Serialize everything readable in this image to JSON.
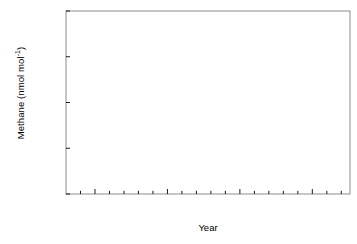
{
  "chart_data": {
    "type": "scatter",
    "title": "",
    "xlabel": "Year",
    "ylabel": "Methane (nmol mol",
    "ylabel_sup": "-1",
    "ylabel_tail": ")",
    "xlim": [
      1983.0,
      2002.6
    ],
    "ylim": [
      1600,
      1800
    ],
    "xticks_major": [
      1985,
      1990,
      1995,
      2000
    ],
    "xtick_labels": [
      "1985",
      "1990",
      "1995",
      "2000"
    ],
    "xticks_minor": [
      1984,
      1986,
      1987,
      1988,
      1989,
      1991,
      1992,
      1993,
      1994,
      1996,
      1997,
      1998,
      1999,
      2001,
      2002
    ],
    "yticks": [
      1600,
      1650,
      1700,
      1750,
      1800
    ],
    "ytick_labels": [
      "1600",
      "1650",
      "1700",
      "1750",
      "1800"
    ],
    "grid": false,
    "legend": null,
    "marker": "square",
    "marker_size_px": 4.6,
    "marker_color": "#000000",
    "frame_color": "#808080",
    "points": [
      [
        1983.3,
        1612
      ],
      [
        1983.46,
        1613
      ],
      [
        1983.96,
        1622
      ],
      [
        1984.05,
        1640
      ],
      [
        1984.13,
        1633
      ],
      [
        1984.21,
        1628
      ],
      [
        1984.3,
        1626
      ],
      [
        1984.38,
        1620
      ],
      [
        1984.46,
        1611
      ],
      [
        1984.55,
        1609
      ],
      [
        1984.63,
        1623
      ],
      [
        1984.71,
        1632
      ],
      [
        1984.8,
        1637
      ],
      [
        1984.88,
        1644
      ],
      [
        1985.05,
        1648
      ],
      [
        1985.13,
        1645
      ],
      [
        1985.21,
        1643
      ],
      [
        1985.3,
        1639
      ],
      [
        1985.38,
        1633
      ],
      [
        1985.46,
        1627
      ],
      [
        1985.55,
        1631
      ],
      [
        1985.63,
        1638
      ],
      [
        1985.71,
        1645
      ],
      [
        1985.8,
        1650
      ],
      [
        1985.88,
        1654
      ],
      [
        1986.05,
        1657
      ],
      [
        1986.13,
        1656
      ],
      [
        1986.21,
        1653
      ],
      [
        1986.3,
        1650
      ],
      [
        1986.38,
        1646
      ],
      [
        1986.46,
        1641
      ],
      [
        1986.55,
        1643
      ],
      [
        1986.63,
        1649
      ],
      [
        1986.71,
        1655
      ],
      [
        1986.8,
        1660
      ],
      [
        1986.88,
        1663
      ],
      [
        1987.05,
        1665
      ],
      [
        1987.13,
        1664
      ],
      [
        1987.21,
        1662
      ],
      [
        1987.3,
        1658
      ],
      [
        1987.38,
        1653
      ],
      [
        1987.46,
        1648
      ],
      [
        1987.55,
        1651
      ],
      [
        1987.63,
        1657
      ],
      [
        1987.71,
        1663
      ],
      [
        1987.8,
        1668
      ],
      [
        1987.88,
        1671
      ],
      [
        1988.05,
        1675
      ],
      [
        1988.13,
        1678
      ],
      [
        1988.21,
        1673
      ],
      [
        1988.3,
        1669
      ],
      [
        1988.38,
        1664
      ],
      [
        1988.46,
        1659
      ],
      [
        1988.55,
        1662
      ],
      [
        1988.63,
        1668
      ],
      [
        1988.71,
        1674
      ],
      [
        1988.8,
        1679
      ],
      [
        1988.88,
        1683
      ],
      [
        1989.05,
        1686
      ],
      [
        1989.13,
        1685
      ],
      [
        1989.21,
        1682
      ],
      [
        1989.3,
        1678
      ],
      [
        1989.38,
        1673
      ],
      [
        1989.46,
        1669
      ],
      [
        1989.55,
        1672
      ],
      [
        1989.63,
        1678
      ],
      [
        1989.71,
        1684
      ],
      [
        1989.8,
        1689
      ],
      [
        1989.88,
        1692
      ],
      [
        1990.05,
        1695
      ],
      [
        1990.13,
        1694
      ],
      [
        1990.21,
        1691
      ],
      [
        1990.3,
        1687
      ],
      [
        1990.38,
        1682
      ],
      [
        1990.46,
        1678
      ],
      [
        1990.55,
        1681
      ],
      [
        1990.63,
        1687
      ],
      [
        1990.71,
        1693
      ],
      [
        1990.8,
        1698
      ],
      [
        1990.88,
        1701
      ],
      [
        1991.05,
        1706
      ],
      [
        1991.13,
        1705
      ],
      [
        1991.21,
        1702
      ],
      [
        1991.3,
        1698
      ],
      [
        1991.38,
        1693
      ],
      [
        1991.46,
        1689
      ],
      [
        1991.55,
        1693
      ],
      [
        1991.63,
        1700
      ],
      [
        1991.71,
        1707
      ],
      [
        1991.8,
        1712
      ],
      [
        1991.88,
        1716
      ],
      [
        1992.05,
        1719
      ],
      [
        1992.13,
        1718
      ],
      [
        1992.21,
        1715
      ],
      [
        1992.3,
        1711
      ],
      [
        1992.38,
        1706
      ],
      [
        1992.46,
        1702
      ],
      [
        1992.55,
        1705
      ],
      [
        1992.63,
        1711
      ],
      [
        1992.71,
        1716
      ],
      [
        1992.8,
        1720
      ],
      [
        1992.88,
        1723
      ],
      [
        1993.05,
        1725
      ],
      [
        1993.13,
        1724
      ],
      [
        1993.21,
        1721
      ],
      [
        1993.3,
        1717
      ],
      [
        1993.38,
        1712
      ],
      [
        1993.46,
        1708
      ],
      [
        1993.55,
        1710
      ],
      [
        1993.63,
        1716
      ],
      [
        1993.71,
        1721
      ],
      [
        1993.8,
        1725
      ],
      [
        1993.88,
        1728
      ],
      [
        1994.05,
        1730
      ],
      [
        1994.13,
        1729
      ],
      [
        1994.21,
        1726
      ],
      [
        1994.3,
        1722
      ],
      [
        1994.38,
        1717
      ],
      [
        1994.46,
        1713
      ],
      [
        1994.55,
        1716
      ],
      [
        1994.63,
        1722
      ],
      [
        1994.71,
        1727
      ],
      [
        1994.8,
        1731
      ],
      [
        1994.88,
        1734
      ],
      [
        1995.05,
        1736
      ],
      [
        1995.13,
        1748
      ],
      [
        1995.21,
        1733
      ],
      [
        1995.3,
        1729
      ],
      [
        1995.38,
        1724
      ],
      [
        1995.46,
        1720
      ],
      [
        1995.55,
        1710
      ],
      [
        1995.63,
        1722
      ],
      [
        1995.71,
        1729
      ],
      [
        1995.8,
        1734
      ],
      [
        1995.88,
        1738
      ],
      [
        1996.05,
        1740
      ],
      [
        1996.13,
        1739
      ],
      [
        1996.21,
        1736
      ],
      [
        1996.3,
        1732
      ],
      [
        1996.38,
        1727
      ],
      [
        1996.46,
        1723
      ],
      [
        1996.55,
        1726
      ],
      [
        1996.63,
        1732
      ],
      [
        1996.71,
        1738
      ],
      [
        1996.8,
        1742
      ],
      [
        1996.88,
        1745
      ],
      [
        1997.05,
        1747
      ],
      [
        1997.13,
        1746
      ],
      [
        1997.21,
        1743
      ],
      [
        1997.3,
        1739
      ],
      [
        1997.38,
        1734
      ],
      [
        1997.46,
        1729
      ],
      [
        1997.55,
        1732
      ],
      [
        1997.63,
        1738
      ],
      [
        1997.71,
        1744
      ],
      [
        1997.8,
        1748
      ],
      [
        1997.88,
        1751
      ],
      [
        1998.05,
        1753
      ],
      [
        1998.13,
        1752
      ],
      [
        1998.21,
        1749
      ],
      [
        1998.3,
        1745
      ],
      [
        1998.38,
        1739
      ],
      [
        1998.46,
        1734
      ],
      [
        1998.55,
        1738
      ],
      [
        1998.63,
        1745
      ],
      [
        1998.71,
        1752
      ],
      [
        1998.8,
        1757
      ],
      [
        1998.88,
        1761
      ],
      [
        1999.05,
        1768
      ],
      [
        1999.13,
        1776
      ],
      [
        1999.21,
        1766
      ],
      [
        1999.3,
        1758
      ],
      [
        1999.38,
        1752
      ],
      [
        1999.46,
        1745
      ],
      [
        1999.55,
        1740
      ],
      [
        1999.63,
        1748
      ],
      [
        1999.71,
        1757
      ],
      [
        1999.8,
        1763
      ],
      [
        1999.88,
        1766
      ],
      [
        2000.05,
        1769
      ],
      [
        2000.13,
        1768
      ],
      [
        2000.21,
        1763
      ],
      [
        2000.3,
        1757
      ],
      [
        2000.38,
        1750
      ],
      [
        2000.46,
        1744
      ],
      [
        2000.55,
        1739
      ],
      [
        2000.63,
        1747
      ],
      [
        2000.71,
        1756
      ],
      [
        2000.8,
        1762
      ],
      [
        2000.88,
        1765
      ],
      [
        2001.05,
        1770
      ],
      [
        2001.13,
        1772
      ],
      [
        2001.21,
        1766
      ],
      [
        2001.3,
        1759
      ],
      [
        2001.38,
        1752
      ],
      [
        2001.46,
        1746
      ],
      [
        2001.55,
        1741
      ],
      [
        2001.63,
        1749
      ],
      [
        2001.71,
        1758
      ],
      [
        2001.8,
        1764
      ],
      [
        2001.88,
        1767
      ],
      [
        2002.05,
        1766
      ],
      [
        2002.13,
        1763
      ],
      [
        2002.21,
        1757
      ],
      [
        2002.3,
        1750
      ],
      [
        2002.38,
        1744
      ],
      [
        2002.46,
        1738
      ]
    ]
  }
}
